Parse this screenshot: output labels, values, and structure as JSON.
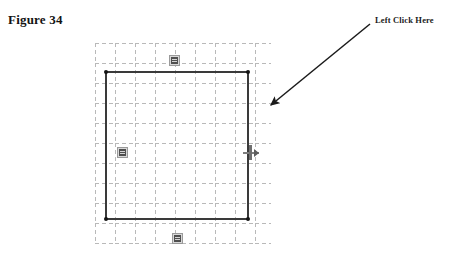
{
  "figure": {
    "title": "Figure 34"
  },
  "annotation": {
    "label": "Left Click Here",
    "arrow": {
      "name": "pointer-arrow",
      "start_x": 370,
      "start_y": 24,
      "end_x": 267,
      "end_y": 109,
      "color": "#1a1a1a"
    }
  },
  "canvas": {
    "name": "cad-drawing-canvas",
    "background": "#ffffff",
    "grid": {
      "style": "dashed",
      "color": "#b9b9b9",
      "spacing_px": 20,
      "left": 95,
      "top": 43,
      "width": 176,
      "height": 201
    },
    "shape": {
      "type": "rectangle",
      "name": "drawn-rectangle",
      "stroke_color": "#3a3a3a",
      "stroke_width": 2,
      "x": 105,
      "y": 71,
      "width": 144,
      "height": 149
    },
    "handles": [
      {
        "name": "vertex-handle-top-left",
        "position": "top-left"
      },
      {
        "name": "vertex-handle-top-right",
        "position": "top-right"
      },
      {
        "name": "vertex-handle-bottom-left",
        "position": "bottom-left"
      },
      {
        "name": "vertex-handle-bottom-right",
        "position": "bottom-right"
      }
    ],
    "edge_grip": {
      "name": "right-edge-grip-handle",
      "color": "#6f6f6f"
    },
    "badges": [
      {
        "name": "dimension-badge-top",
        "position": "top"
      },
      {
        "name": "dimension-badge-left",
        "position": "left"
      },
      {
        "name": "dimension-badge-bottom",
        "position": "bottom"
      }
    ]
  },
  "colors": {
    "page_background": "#ffffff",
    "text": "#131313",
    "shape_stroke": "#3a3a3a",
    "grid_line": "#b9b9b9",
    "badge_fill": "#d8d8d8"
  }
}
